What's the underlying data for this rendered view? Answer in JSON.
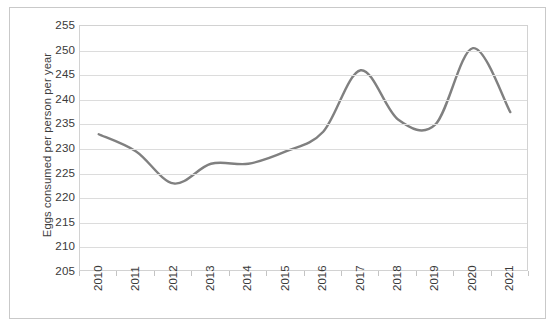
{
  "chart_data": {
    "type": "line",
    "title": "",
    "xlabel": "",
    "ylabel": "Eggs consumed per person per year",
    "categories": [
      "2010",
      "2011",
      "2012",
      "2013",
      "2014",
      "2015",
      "2016",
      "2017",
      "2018",
      "2019",
      "2020",
      "2021"
    ],
    "values": [
      233,
      229.5,
      223,
      227,
      227,
      229.5,
      233.5,
      246,
      236,
      235,
      250.5,
      237.5
    ],
    "series": [
      {
        "name": "Eggs consumed per person per year",
        "values": [
          233,
          229.5,
          223,
          227,
          227,
          229.5,
          233.5,
          246,
          236,
          235,
          250.5,
          237.5
        ]
      }
    ],
    "ylim": [
      205,
      255
    ],
    "yticks": [
      205,
      210,
      215,
      220,
      225,
      230,
      235,
      240,
      245,
      250,
      255
    ],
    "ytick_labels": [
      "205",
      "210",
      "215",
      "220",
      "225",
      "230",
      "235",
      "240",
      "245",
      "250",
      "255"
    ],
    "grid": true,
    "grid_axis": "y",
    "legend": false,
    "legend_position": "none",
    "line_color": "#808080",
    "line_width": 2.4,
    "smoothing": "spline",
    "markers": false,
    "plot_border_color": "#d2d2d2",
    "gridline_color": "#dcdcdc",
    "frame_color": "#c9c9c9",
    "background_color": "#ffffff",
    "text_color": "#3a3a3a"
  }
}
